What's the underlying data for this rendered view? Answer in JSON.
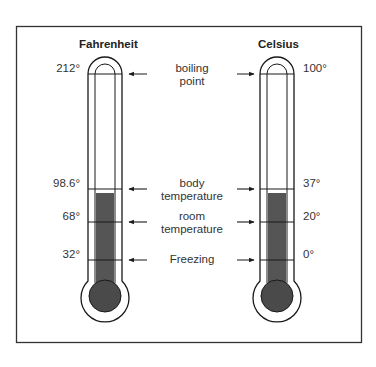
{
  "scales": {
    "fahrenheit": {
      "title": "Fahrenheit",
      "ticks": [
        "212°",
        "98.6°",
        "68°",
        "32°"
      ]
    },
    "celsius": {
      "title": "Celsius",
      "ticks": [
        "100°",
        "37°",
        "20°",
        "0°"
      ]
    }
  },
  "markers": [
    {
      "line1": "boiling",
      "line2": "point",
      "fahrenheit": "212°",
      "celsius": "100°"
    },
    {
      "line1": "body",
      "line2": "temperature",
      "fahrenheit": "98.6°",
      "celsius": "37°"
    },
    {
      "line1": "room",
      "line2": "temperature",
      "fahrenheit": "68°",
      "celsius": "20°"
    },
    {
      "line1": "Freezing",
      "line2": "",
      "fahrenheit": "32°",
      "celsius": "0°"
    }
  ],
  "colors": {
    "outline": "#1a1a1a",
    "fluid": "#555555",
    "frame": "#333333",
    "background": "#ffffff"
  }
}
